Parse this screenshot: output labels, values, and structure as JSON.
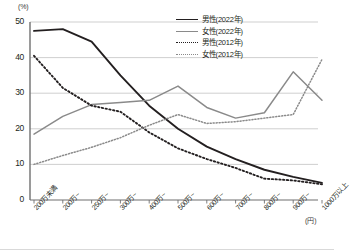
{
  "chart_data": {
    "type": "line",
    "title": "",
    "xlabel": "(円)",
    "ylabel": "(%)",
    "ylim": [
      0,
      50
    ],
    "yticks": [
      0,
      10,
      20,
      30,
      40,
      50
    ],
    "grid": true,
    "legend_position": "top-right",
    "categories": [
      "200万未満",
      "200万~",
      "250万~",
      "300万~",
      "400万~",
      "500万~",
      "600万~",
      "700万~",
      "800万~",
      "900万~",
      "1000万以上"
    ],
    "series": [
      {
        "name": "男性(2022年)",
        "style": "solid",
        "color": "#231f20",
        "values": [
          47.5,
          48.0,
          44.5,
          35.0,
          26.5,
          20.0,
          15.0,
          11.5,
          8.5,
          6.5,
          4.8
        ]
      },
      {
        "name": "女性(2022年)",
        "style": "solid",
        "color": "#8a8a8a",
        "values": [
          18.5,
          23.5,
          26.8,
          27.4,
          28.0,
          32.0,
          26.0,
          23.0,
          24.5,
          36.0,
          28.0
        ]
      },
      {
        "name": "男性(2012年)",
        "style": "dotted",
        "color": "#231f20",
        "values": [
          40.5,
          31.5,
          26.5,
          24.8,
          19.0,
          14.5,
          11.5,
          9.0,
          6.0,
          5.5,
          4.4
        ]
      },
      {
        "name": "女性(2012年)",
        "style": "dotted",
        "color": "#8a8a8a",
        "values": [
          10.0,
          12.5,
          14.8,
          17.5,
          21.0,
          24.0,
          21.5,
          22.0,
          23.0,
          24.0,
          39.5
        ]
      }
    ]
  },
  "axis": {
    "y_unit": "(%)",
    "x_unit": "(円)",
    "y_labels": [
      "50",
      "40",
      "30",
      "20",
      "10",
      "0"
    ]
  }
}
